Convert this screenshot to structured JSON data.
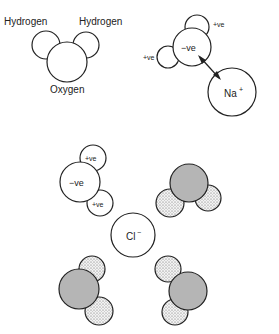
{
  "labels": {
    "hydrogen_left": "Hydrogen",
    "hydrogen_right": "Hydrogen",
    "oxygen": "Oxygen",
    "pos1": "+ve",
    "pos2": "+ve",
    "neg1": "−ve",
    "sodium": "Na",
    "sodium_charge": "+",
    "pos3": "+ve",
    "pos4": "+ve",
    "neg2": "−ve",
    "chloride": "Cl",
    "chloride_charge": "−"
  },
  "colors": {
    "stroke": "#222222",
    "oxygen_fill_shaded": "#b5b5b5",
    "hydrogen_fill_dotted": "#e6e6e6"
  }
}
